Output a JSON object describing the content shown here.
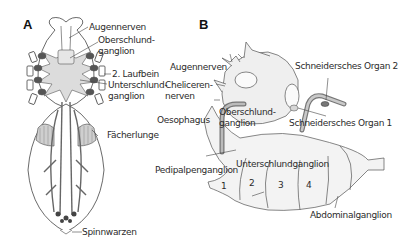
{
  "figure": {
    "panels": [
      {
        "id": "A",
        "letter": "A",
        "labels": {
          "augennerven": "Augennerven",
          "oberschlundganglion_1": "Oberschlund-",
          "oberschlundganglion_2": "ganglion",
          "laufbein": "2. Laufbein",
          "unterschlundganglion_1": "Unterschlund-",
          "unterschlundganglion_2": "ganglion",
          "faecherlunge": "Fächerlunge",
          "spinnwarzen": "Spinnwarzen"
        }
      },
      {
        "id": "B",
        "letter": "B",
        "labels": {
          "augennerven": "Augennerven",
          "cheliceren_1": "Cheliceren-",
          "cheliceren_2": "nerven",
          "oesophagus": "Oesophagus",
          "oberschlundganglion_1": "Oberschlund-",
          "oberschlundganglion_2": "ganglion",
          "schneider2": "Schneidersches Organ 2",
          "schneider1": "Schneidersches Organ 1",
          "pedipalpenganglion": "Pedipalpenganglion",
          "unterschlundganglion": "Unterschlundganglion",
          "seg1": "1",
          "seg2": "2",
          "seg3": "3",
          "seg4": "4",
          "abdominalganglion": "Abdominalganglion"
        }
      }
    ],
    "colors": {
      "ganglion_fill": "#dcdcdc",
      "ganglion_light": "#efefef",
      "outline": "#444444",
      "dark_lobes": "#555555",
      "background": "#ffffff"
    }
  }
}
